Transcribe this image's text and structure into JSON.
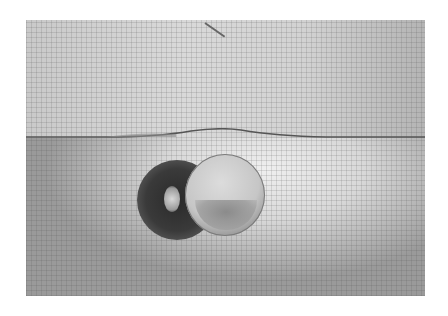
{
  "image": {
    "description": "Grayscale photograph of a coin floating at a water surface in a tank with a grid-paper background; the coin and its dark shadow are visible below the meniscus-curved waterline.",
    "colors": {
      "background": "#ffffff",
      "water_upper": "#d2d2d2",
      "shadow": "#2a2a2a",
      "coin": "#c6c6c6"
    }
  }
}
